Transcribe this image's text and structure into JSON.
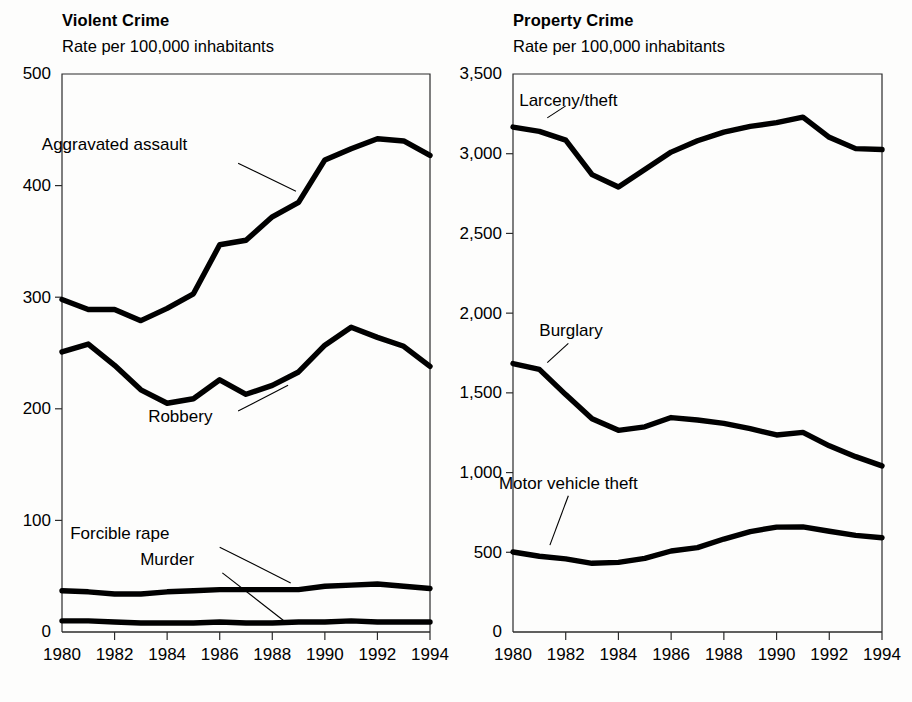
{
  "page": {
    "background_color": "#fdfdfc",
    "ink_color": "#000000"
  },
  "panels": {
    "left": {
      "title": "Violent Crime",
      "subtitle": "Rate per 100,000 inhabitants"
    },
    "right": {
      "title": "Property Crime",
      "subtitle": "Rate per 100,000 inhabitants"
    }
  },
  "chart_data": [
    {
      "type": "line",
      "title": "Violent Crime",
      "subtitle": "Rate per 100,000 inhabitants",
      "xlabel": "",
      "ylabel": "Rate per 100,000 inhabitants",
      "grid": false,
      "legend_position": "inline-annotations",
      "x": [
        1980,
        1981,
        1982,
        1983,
        1984,
        1985,
        1986,
        1987,
        1988,
        1989,
        1990,
        1991,
        1992,
        1993,
        1994
      ],
      "xlim": [
        1980,
        1994
      ],
      "ylim": [
        0,
        500
      ],
      "yticks": [
        0,
        100,
        200,
        300,
        400,
        500
      ],
      "ytick_labels": [
        "0",
        "100",
        "200",
        "300",
        "400",
        "500"
      ],
      "xticks": [
        1980,
        1982,
        1984,
        1986,
        1988,
        1990,
        1992,
        1994
      ],
      "xtick_labels": [
        "1980",
        "1982",
        "1984",
        "1986",
        "1988",
        "1990",
        "1992",
        "1994"
      ],
      "series": [
        {
          "name": "Aggravated assault",
          "label_xy": [
            1982.0,
            432
          ],
          "leader_from": [
            1986.7,
            420
          ],
          "leader_to": [
            1988.9,
            395
          ],
          "values": [
            298,
            289,
            289,
            279,
            290,
            303,
            347,
            351,
            372,
            385,
            423,
            433,
            442,
            440,
            427
          ]
        },
        {
          "name": "Robbery",
          "label_xy": [
            1984.5,
            188
          ],
          "leader_from": [
            1986.7,
            198
          ],
          "leader_to": [
            1988.6,
            221
          ],
          "values": [
            251,
            258,
            239,
            217,
            205,
            209,
            226,
            213,
            221,
            233,
            257,
            273,
            264,
            256,
            238
          ]
        },
        {
          "name": "Forcible rape",
          "label_xy": [
            1982.2,
            83
          ],
          "leader_from": [
            1986.0,
            76
          ],
          "leader_to": [
            1988.7,
            44
          ],
          "values": [
            37,
            36,
            34,
            34,
            36,
            37,
            38,
            38,
            38,
            38,
            41,
            42,
            43,
            41,
            39
          ]
        },
        {
          "name": "Murder",
          "label_xy": [
            1984.0,
            60
          ],
          "leader_from": [
            1986.1,
            53
          ],
          "leader_to": [
            1988.5,
            9
          ],
          "values": [
            10,
            10,
            9,
            8,
            8,
            8,
            9,
            8,
            8,
            9,
            9,
            10,
            9,
            9,
            9
          ]
        }
      ]
    },
    {
      "type": "line",
      "title": "Property Crime",
      "subtitle": "Rate per 100,000 inhabitants",
      "xlabel": "",
      "ylabel": "Rate per 100,000 inhabitants",
      "grid": false,
      "legend_position": "inline-annotations",
      "x": [
        1980,
        1981,
        1982,
        1983,
        1984,
        1985,
        1986,
        1987,
        1988,
        1989,
        1990,
        1991,
        1992,
        1993,
        1994
      ],
      "xlim": [
        1980,
        1994
      ],
      "ylim": [
        0,
        3500
      ],
      "yticks": [
        0,
        500,
        1000,
        1500,
        2000,
        2500,
        3000,
        3500
      ],
      "ytick_labels": [
        "0",
        "500",
        "1,000",
        "1,500",
        "2,000",
        "2,500",
        "3,000",
        "3,500"
      ],
      "xticks": [
        1980,
        1982,
        1984,
        1986,
        1988,
        1990,
        1992,
        1994
      ],
      "xtick_labels": [
        "1980",
        "1982",
        "1984",
        "1986",
        "1988",
        "1990",
        "1992",
        "1994"
      ],
      "series": [
        {
          "name": "Larceny/theft",
          "label_xy": [
            1982.1,
            3300
          ],
          "leader_from": [
            1981.3,
            3225
          ],
          "leader_to": [
            1982.0,
            3300
          ],
          "values": [
            3167,
            3140,
            3085,
            2869,
            2791,
            2901,
            3010,
            3081,
            3135,
            3171,
            3195,
            3229,
            3103,
            3032,
            3026
          ]
        },
        {
          "name": "Burglary",
          "label_xy": [
            1982.2,
            1855
          ],
          "leader_from": [
            1981.3,
            1690
          ],
          "leader_to": [
            1982.1,
            1810
          ]
        },
        {
          "name": "Motor vehicle theft",
          "label_xy": [
            1982.1,
            900
          ],
          "leader_from": [
            1981.4,
            545
          ],
          "leader_to": [
            1982.1,
            855
          ]
        }
      ],
      "series_values": {
        "Burglary": [
          1684,
          1647,
          1489,
          1338,
          1265,
          1287,
          1345,
          1330,
          1309,
          1276,
          1236,
          1252,
          1168,
          1100,
          1042
        ],
        "Motor vehicle theft": [
          502,
          475,
          459,
          431,
          437,
          462,
          508,
          529,
          583,
          630,
          658,
          659,
          632,
          606,
          591
        ]
      }
    }
  ]
}
